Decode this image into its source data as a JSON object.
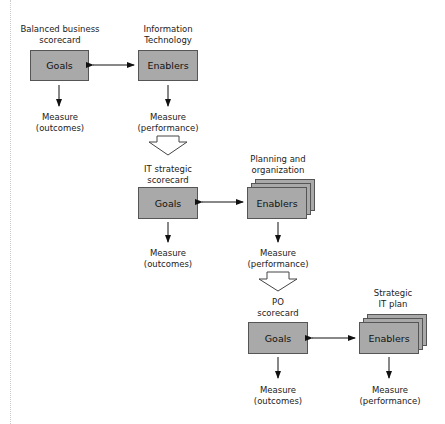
{
  "diagram": {
    "level1": {
      "left_title": "Balanced business\nscorecard",
      "right_title": "Information\nTechnology",
      "goals": "Goals",
      "enablers": "Enablers",
      "left_measure": "Measure\n(outcomes)",
      "right_measure": "Measure\n(performance)"
    },
    "level2": {
      "left_title": "IT strategic\nscorecard",
      "right_title": "Planning and\norganization",
      "goals": "Goals",
      "enablers": "Enablers",
      "left_measure": "Measure\n(outcomes)",
      "right_measure": "Measure\n(performance)"
    },
    "level3": {
      "left_title": "PO\nscorecard",
      "right_title": "Strategic\nIT plan",
      "goals": "Goals",
      "enablers": "Enablers",
      "left_measure": "Measure\n(outcomes)",
      "right_measure": "Measure\n(performance)"
    },
    "colors": {
      "box_fill": "#a9a9a9",
      "box_border": "#555555",
      "arrow": "#111111"
    }
  }
}
